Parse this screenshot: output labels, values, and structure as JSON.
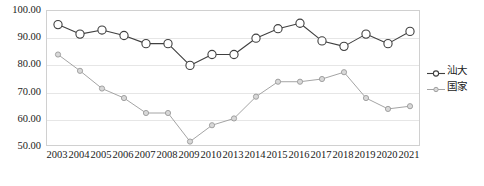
{
  "chart_data": {
    "type": "line",
    "title": "",
    "xlabel": "",
    "ylabel": "",
    "ylim": [
      50.0,
      100.0
    ],
    "ytick_step": 10.0,
    "ytick_labels": [
      "100.00",
      "90.00",
      "80.00",
      "70.00",
      "60.00",
      "50.00"
    ],
    "ytick_values": [
      100.0,
      90.0,
      80.0,
      70.0,
      60.0,
      50.0
    ],
    "grid": true,
    "legend_position": "right",
    "categories": [
      "2003",
      "2004",
      "2005",
      "2006",
      "2007",
      "2008",
      "2009",
      "2010",
      "2013",
      "2014",
      "2015",
      "2016",
      "2017",
      "2018",
      "2019",
      "2020",
      "2021"
    ],
    "series": [
      {
        "name": "汕大",
        "color": "#404040",
        "marker": "circle-open-large",
        "values": [
          95.0,
          91.5,
          93.0,
          91.0,
          88.0,
          88.0,
          80.0,
          84.0,
          84.0,
          90.0,
          93.5,
          95.5,
          89.0,
          87.0,
          91.5,
          88.0,
          92.5
        ]
      },
      {
        "name": "国家",
        "color": "#9a9a9a",
        "marker": "circle-open-small",
        "values": [
          84.0,
          78.0,
          71.5,
          68.0,
          62.5,
          62.5,
          52.0,
          58.0,
          60.5,
          68.5,
          74.0,
          74.0,
          75.0,
          77.5,
          68.0,
          64.0,
          65.0
        ]
      }
    ]
  },
  "legend": {
    "items": [
      {
        "label": "汕大",
        "color": "#404040"
      },
      {
        "label": "国家",
        "color": "#9a9a9a"
      }
    ]
  },
  "colors": {
    "series_1": "#404040",
    "series_2": "#9a9a9a",
    "grid": "#e6e6e6",
    "axis_border": "#d0d0d0",
    "text": "#1a1a1a",
    "background": "#ffffff"
  }
}
